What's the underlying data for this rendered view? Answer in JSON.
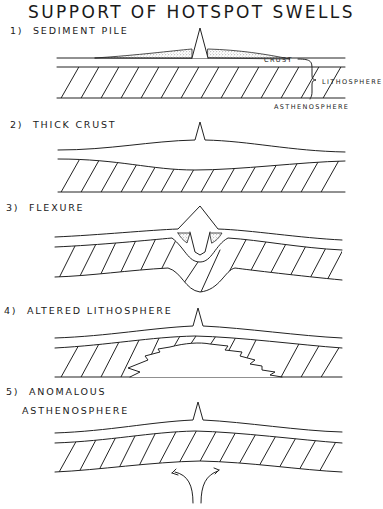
{
  "title": "SUPPORT OF HOTSPOT SWELLS",
  "panels": [
    {
      "number": "1)",
      "label": "SEDIMENT PILE",
      "annotations": {
        "crust": "CRUST",
        "lithosphere": "LITHOSPHERE",
        "asthenosphere": "ASTHENOSPHERE"
      }
    },
    {
      "number": "2)",
      "label": "THICK CRUST"
    },
    {
      "number": "3)",
      "label": "FLEXURE"
    },
    {
      "number": "4)",
      "label": "ALTERED LITHOSPHERE",
      "annotations": {
        "region": "LOW-DENSITY"
      }
    },
    {
      "number": "5)",
      "label_line1": "ANOMALOUS",
      "label_line2": "ASTHENOSPHERE"
    }
  ],
  "colors": {
    "ink": "#222222",
    "background": "#ffffff"
  }
}
